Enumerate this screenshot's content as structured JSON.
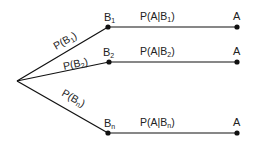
{
  "diagram": {
    "root": {
      "x": 17,
      "y": 81
    },
    "branches": [
      {
        "node_label": "B",
        "node_sub": "1",
        "edge_label": "P(B",
        "edge_sub": "1",
        "cond_label": "P(A|B",
        "cond_sub": "1",
        "end_label": "A",
        "y": 27
      },
      {
        "node_label": "B",
        "node_sub": "2",
        "edge_label": "P(B",
        "edge_sub": "2",
        "cond_label": "P(A|B",
        "cond_sub": "2",
        "end_label": "A",
        "y": 62
      },
      {
        "node_label": "B",
        "node_sub": "n",
        "edge_label": "P(B",
        "edge_sub": "n",
        "cond_label": "P(A|B",
        "cond_sub": "n",
        "end_label": "A",
        "y": 133
      }
    ],
    "close_paren": ")"
  }
}
